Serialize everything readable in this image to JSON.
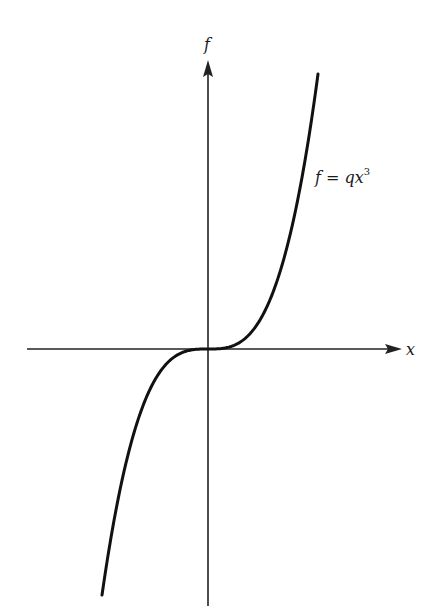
{
  "chart_data": {
    "type": "line",
    "title": "",
    "xlabel": "x",
    "ylabel": "f",
    "annotation": {
      "text_main": "f = qx",
      "superscript": "3"
    },
    "function": "f = q*x^3",
    "grid": false,
    "legend": "none",
    "ticks": "none",
    "series": [
      {
        "name": "f = qx^3",
        "x": [
          -1.0,
          -0.75,
          -0.5,
          -0.25,
          0,
          0.25,
          0.5,
          0.75,
          1.0
        ],
        "values": [
          -1.0,
          -0.422,
          -0.125,
          -0.016,
          0,
          0.016,
          0.125,
          0.422,
          1.0
        ]
      }
    ]
  },
  "labels": {
    "x_axis": "x",
    "y_axis": "f",
    "curve_main": "f = qx",
    "curve_sup": "3"
  },
  "style": {
    "axis_color": "#222222",
    "curve_color": "#111111"
  }
}
